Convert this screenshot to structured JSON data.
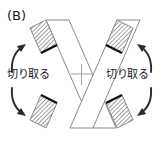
{
  "figure": {
    "panel_label": "(B)",
    "labels": {
      "cut_left": "切り取る",
      "cut_right": "切り取る"
    },
    "colors": {
      "outline": "#8a8a8a",
      "hatch": "#555555",
      "thick_edge": "#111111",
      "arrow": "#2b2b2b",
      "background": "#ffffff",
      "text": "#1a1a1a",
      "center_mark": "#9a9a9a"
    },
    "icons": {
      "arrow_top_left": "curved-arrow-up-right-icon",
      "arrow_bottom_left": "curved-arrow-down-right-icon",
      "arrow_top_right": "curved-arrow-up-left-icon",
      "arrow_bottom_right": "curved-arrow-down-left-icon"
    }
  }
}
